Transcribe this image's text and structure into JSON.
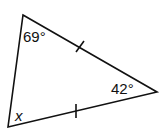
{
  "diagram": {
    "type": "triangle",
    "vertices": {
      "top": [
        23,
        15
      ],
      "right": [
        157,
        92
      ],
      "bottom_left": [
        8,
        127
      ]
    },
    "angles": {
      "top": "69°",
      "right": "42°",
      "bottom_left": "x"
    },
    "congruent_sides": [
      "top-right",
      "bottom_left-right"
    ],
    "stroke_color": "#111111"
  }
}
